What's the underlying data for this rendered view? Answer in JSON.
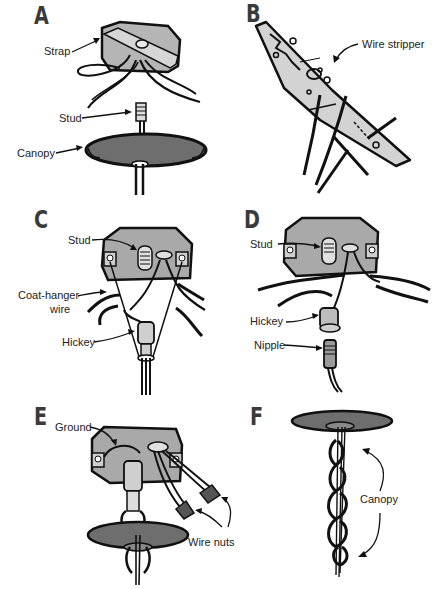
{
  "figure": {
    "colors": {
      "box_fill": "#a9a9a9",
      "box_light": "#cfcfcf",
      "canopy_fill": "#6e6e6e",
      "tool_fill": "#d3d3d3",
      "ink": "#111111"
    },
    "panels": [
      {
        "letter": "A",
        "labels": [
          "Strap",
          "Stud",
          "Canopy"
        ]
      },
      {
        "letter": "B",
        "labels": [
          "Wire stripper"
        ]
      },
      {
        "letter": "C",
        "labels": [
          "Stud",
          "Coat-hanger",
          "wire",
          "Hickey"
        ]
      },
      {
        "letter": "D",
        "labels": [
          "Stud",
          "Hickey",
          "Nipple"
        ]
      },
      {
        "letter": "E",
        "labels": [
          "Ground",
          "Wire nuts"
        ]
      },
      {
        "letter": "F",
        "labels": [
          "Canopy"
        ]
      }
    ]
  }
}
